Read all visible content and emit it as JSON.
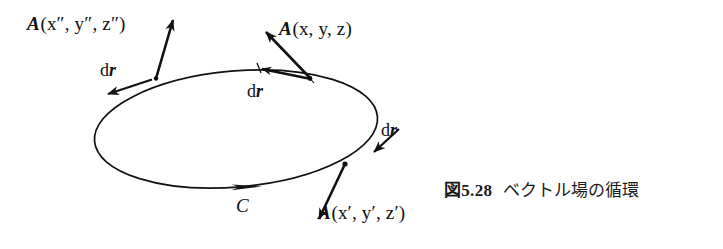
{
  "figure": {
    "domain_kind": "textbook-vector-field-diagram",
    "background_color": "#ffffff",
    "ink_color": "#111111",
    "curve": {
      "name": "C",
      "label": "C",
      "shape": "ellipse",
      "orientation": "counterclockwise-in-plane (arrow at bottom points right)",
      "center_x": 236,
      "center_y": 129,
      "radius_x": 142,
      "radius_y": 58,
      "rotation_deg": -5
    },
    "labels": {
      "A_top_right": {
        "symbol": "A",
        "args": "(x, y, z)",
        "full": "A(x, y, z)"
      },
      "A_top_left": {
        "symbol": "A",
        "args": "(x″, y″, z″)",
        "full": "A(x″, y″, z″)"
      },
      "A_bottom_right": {
        "symbol": "A",
        "args": "(x′, y′, z′)",
        "full": "A(x′, y′, z′)"
      },
      "dr_left": {
        "d": "d",
        "r": "r",
        "full": "dr"
      },
      "dr_top": {
        "d": "d",
        "r": "r",
        "full": "dr"
      },
      "dr_right": {
        "d": "d",
        "r": "r",
        "full": "dr"
      },
      "curve_label": "C"
    },
    "vectors": [
      {
        "name": "A-at-x-y-z",
        "kind": "field-vector",
        "from": [
          310,
          78
        ],
        "to": [
          262,
          28
        ],
        "label": "A(x, y, z)"
      },
      {
        "name": "A-at-x2-y2-z2",
        "kind": "field-vector",
        "from": [
          156,
          78
        ],
        "to": [
          174,
          12
        ],
        "label": "A(x″, y″, z″)"
      },
      {
        "name": "A-at-x1-y1-z1",
        "kind": "field-vector",
        "from": [
          345,
          164
        ],
        "to": [
          316,
          225
        ],
        "label": "A(x′, y′, z′)"
      },
      {
        "name": "dr-left",
        "kind": "tangent-vector",
        "from": [
          150,
          80
        ],
        "to": [
          104,
          96
        ],
        "label": "dr"
      },
      {
        "name": "dr-top",
        "kind": "tangent-vector",
        "from": [
          311,
          79
        ],
        "to": [
          257,
          68
        ],
        "label": "dr"
      },
      {
        "name": "dr-right",
        "kind": "tangent-vector",
        "from": [
          400,
          131
        ],
        "to": [
          371,
          156
        ],
        "label": "dr"
      }
    ],
    "curve_direction_arrow": {
      "name": "curve-orientation-arrow",
      "at": [
        256,
        185
      ],
      "direction": "right"
    },
    "points_on_curve": [
      {
        "name": "point-x-y-z",
        "at": [
          310,
          78
        ]
      },
      {
        "name": "point-x2-y2-z2",
        "at": [
          156,
          78
        ]
      },
      {
        "name": "point-x1-y1-z1",
        "at": [
          345,
          164
        ]
      }
    ]
  },
  "caption": {
    "prefix": "図",
    "number": "5.28",
    "text": "ベクトル場の循環",
    "full": "図 5.28  ベクトル場の循環"
  }
}
